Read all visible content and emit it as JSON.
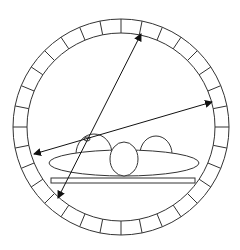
{
  "diagram": {
    "ring": {
      "cx": 121,
      "cy": 127,
      "outer_r": 108,
      "inner_r": 94,
      "segments": 32
    },
    "arrows": [
      {
        "name": "arrow-steep",
        "x1": 58,
        "y1": 198,
        "x2": 141,
        "y2": 34
      },
      {
        "name": "arrow-shallow",
        "x1": 34,
        "y1": 154,
        "x2": 212,
        "y2": 102
      }
    ],
    "colors": {
      "stroke": "#222222",
      "background": "#ffffff"
    }
  }
}
